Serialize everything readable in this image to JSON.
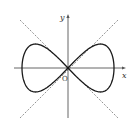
{
  "diagram": {
    "type": "lemniscate-with-asymptotes",
    "colors": {
      "curve": "#1a1a1a",
      "axis": "#555555",
      "dashed": "#777777",
      "background": "#ffffff"
    },
    "labels": {
      "x_axis": "x",
      "y_axis": "y",
      "origin": "O"
    },
    "origin_px": [
      68,
      68
    ],
    "x_axis_px": {
      "from": 14,
      "to": 126,
      "y": 68
    },
    "y_axis_px": {
      "from": 14,
      "to": 118,
      "x": 68
    },
    "curve": {
      "half_width_px": 46,
      "half_height_px": 24
    },
    "dashed_lines": [
      {
        "from": [
          20,
          20
        ],
        "to": [
          118,
          118
        ]
      },
      {
        "from": [
          20,
          118
        ],
        "to": [
          118,
          20
        ]
      }
    ]
  }
}
